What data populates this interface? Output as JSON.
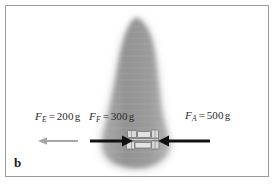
{
  "figure": {
    "panel_letter": "b",
    "background_color": "#ffffff",
    "frame_color": "#9a9a9a",
    "anatomy": {
      "name": "lateral-spine-radiograph-silhouette",
      "fill_color": "#9b9b9b",
      "halo_color": "#c9c9c9"
    },
    "implant": {
      "name": "interbody-fusion-device",
      "fill_color": "#d8d8d8",
      "outline_color": "#6f6f6f"
    },
    "labels": [
      {
        "id": "label-fe",
        "symbol": "F",
        "subscript": "E",
        "equals": "=",
        "value": "200",
        "unit": "g",
        "full_text": "F_E = 200 g"
      },
      {
        "id": "label-ff",
        "symbol": "F",
        "subscript": "F",
        "equals": "=",
        "value": "300",
        "unit": "g",
        "full_text": "F_F = 300 g"
      },
      {
        "id": "label-fa",
        "symbol": "F",
        "subscript": "A",
        "equals": "=",
        "value": "500",
        "unit": "g",
        "full_text": "F_A = 500 g"
      }
    ],
    "arrows": [
      {
        "id": "arrow-fe",
        "name": "force-arrow-extension",
        "direction": "left",
        "color": "#a6a6a6",
        "weight": "thin",
        "x_start": 78,
        "x_end": 38,
        "y": 141
      },
      {
        "id": "arrow-ff",
        "name": "force-arrow-flexion",
        "direction": "right",
        "color": "#111111",
        "weight": "thick",
        "x_start": 90,
        "x_end": 133,
        "y": 141
      },
      {
        "id": "arrow-fa",
        "name": "force-arrow-axial",
        "direction": "left",
        "color": "#111111",
        "weight": "thick",
        "x_start": 210,
        "x_end": 158,
        "y": 141
      }
    ]
  }
}
